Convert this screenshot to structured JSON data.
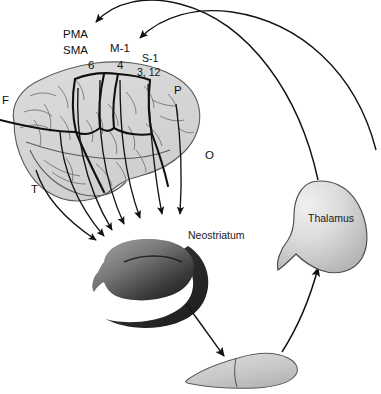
{
  "figure": {
    "background_color": "#ffffff",
    "line_color": "#1a1a1a"
  },
  "cortical_labels": [
    {
      "id": "pma",
      "text": "PMA",
      "x": 63,
      "y": 38
    },
    {
      "id": "sma",
      "text": "SMA",
      "x": 63,
      "y": 54
    },
    {
      "id": "area6",
      "text": "6",
      "x": 88,
      "y": 69
    },
    {
      "id": "m1",
      "text": "M-1",
      "x": 110,
      "y": 52
    },
    {
      "id": "area4",
      "text": "4",
      "x": 117,
      "y": 69
    },
    {
      "id": "s1",
      "text": "S-1",
      "x": 142,
      "y": 62
    },
    {
      "id": "area3-12",
      "text": "3, 12",
      "x": 137,
      "y": 76
    }
  ],
  "lobe_labels": [
    {
      "id": "frontal",
      "text": "F",
      "x": 2,
      "y": 104
    },
    {
      "id": "parietal",
      "text": "P",
      "x": 174,
      "y": 94
    },
    {
      "id": "occipital",
      "text": "O",
      "x": 205,
      "y": 159
    },
    {
      "id": "temporal",
      "text": "T",
      "x": 31,
      "y": 193
    }
  ],
  "structures": [
    {
      "id": "neostriatum",
      "label": "Neostriatum",
      "label_x": 188,
      "label_y": 239,
      "fill_light": "#b4b4b4",
      "fill_dark": "#2e2e2e"
    },
    {
      "id": "thalamus",
      "label": "Thalamus",
      "label_x": 308,
      "label_y": 222,
      "fill_light": "#e2e2e2",
      "fill_dark": "#b8b8b8"
    },
    {
      "id": "substantia-nigra",
      "label": "",
      "label_x": 0,
      "label_y": 0,
      "fill_light": "#d5d5d5",
      "fill_dark": "#bdbdbd"
    }
  ],
  "brain": {
    "fill": "#d8d8d8",
    "outline": "#555555",
    "sulci_color": "#6d6d6d",
    "boundary_color": "#111111"
  },
  "pathways": [
    {
      "id": "corticostriatal",
      "count": 7,
      "description": "cortex to neostriatum"
    },
    {
      "id": "striatonigral",
      "count": 1,
      "description": "neostriatum to substantia nigra"
    },
    {
      "id": "nigrothalamic",
      "count": 1,
      "description": "substantia nigra to thalamus"
    },
    {
      "id": "thalamocortical",
      "count": 2,
      "description": "thalamus to PMA and M-1"
    }
  ]
}
